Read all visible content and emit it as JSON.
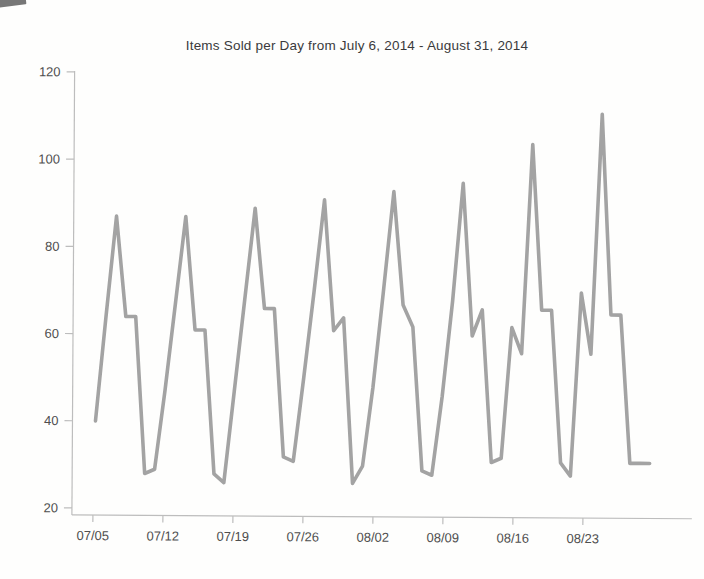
{
  "chart_data": {
    "type": "line",
    "title": "Items Sold per Day from July 6, 2014 - August 31, 2014",
    "series_name": "Items Sold per Day",
    "x": [
      "07/06",
      "07/07",
      "07/08",
      "07/09",
      "07/10",
      "07/11",
      "07/12",
      "07/13",
      "07/14",
      "07/15",
      "07/16",
      "07/17",
      "07/18",
      "07/19",
      "07/20",
      "07/21",
      "07/22",
      "07/23",
      "07/24",
      "07/25",
      "07/26",
      "07/27",
      "07/28",
      "07/29",
      "07/30",
      "07/31",
      "08/01",
      "08/02",
      "08/03",
      "08/04",
      "08/05",
      "08/06",
      "08/07",
      "08/08",
      "08/09",
      "08/10",
      "08/11",
      "08/12",
      "08/13",
      "08/14",
      "08/15",
      "08/16",
      "08/17",
      "08/18",
      "08/19",
      "08/20",
      "08/21",
      "08/22",
      "08/23",
      "08/24",
      "08/25",
      "08/26",
      "08/27",
      "08/28",
      "08/29",
      "08/30",
      "08/31"
    ],
    "values": [
      40,
      64,
      87,
      64,
      64,
      28,
      29,
      47,
      67,
      87,
      61,
      61,
      28,
      26,
      47,
      68,
      89,
      66,
      66,
      32,
      31,
      50,
      70,
      91,
      61,
      64,
      26,
      30,
      48,
      70,
      93,
      67,
      62,
      29,
      28,
      46,
      68,
      95,
      60,
      66,
      31,
      32,
      62,
      56,
      104,
      66,
      66,
      31,
      28,
      70,
      56,
      111,
      65,
      65,
      31,
      31,
      31
    ],
    "x_tick_labels": [
      "07/05",
      "07/12",
      "07/19",
      "07/26",
      "08/02",
      "08/09",
      "08/16",
      "08/23"
    ],
    "y_ticks": [
      20,
      40,
      60,
      80,
      100,
      120
    ],
    "ylim": [
      20,
      120
    ],
    "xlabel": "",
    "ylabel": "",
    "grid": false,
    "legend": "none",
    "weekly_peaks": [
      87,
      87,
      89,
      91,
      93,
      95,
      104,
      111
    ],
    "colors": {
      "line": "#a3a3a3",
      "axis": "#bdbdbd",
      "tick_labels": "#4f4f4f",
      "title": "#3a3a3c",
      "background": "#ffffff"
    }
  }
}
